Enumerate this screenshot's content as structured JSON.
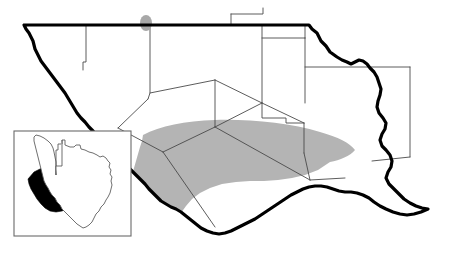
{
  "figure": {
    "type": "distribution-map",
    "region_name": "Trans-Pecos / Big Bend, Texas",
    "background_color": "#ffffff"
  },
  "colors": {
    "shaded_range": "#b4b4b4",
    "point_marker": "#a8a8a8",
    "state_border": "#000000",
    "county_border": "#4a4a4a",
    "inset_highlight": "#000000",
    "inset_frame": "#6a6a6a",
    "land_fill": "#ffffff"
  },
  "main_map": {
    "name": "trans-pecos-county-map",
    "state_outline_path": "M 24 25 L 309 25 L 312 29 L 317 33 L 321 41 L 326 46 L 330 52 L 337 57 L 342 60 L 347 62 L 351 64 L 355 62 L 359 60 L 363 61 L 367 64 L 370 68 L 374 72 L 377 77 L 379 83 L 381 89 L 380 95 L 378 101 L 377 107 L 379 113 L 383 118 L 386 123 L 385 129 L 382 134 L 380 140 L 382 146 L 386 150 L 390 155 L 392 161 L 391 167 L 388 172 L 386 178 L 389 184 L 394 189 L 399 194 L 404 199 L 410 203 L 416 206 L 422 208 L 428 209 L 421 212 L 414 214 L 407 215 L 400 214 L 393 212 L 386 209 L 380 206 L 374 202 L 369 198 L 363 195 L 357 193 L 351 192 L 345 192 L 339 191 L 333 189 L 327 187 L 321 186 L 315 186 L 309 187 L 303 189 L 297 192 L 291 195 L 285 199 L 279 203 L 273 207 L 267 211 L 261 215 L 255 219 L 249 222 L 243 225 L 237 228 L 231 231 L 225 233 L 219 234 L 213 233 L 207 231 L 201 228 L 196 224 L 191 220 L 186 216 L 181 212 L 176 209 L 171 207 L 166 204 L 161 201 L 157 197 L 153 193 L 149 189 L 145 184 L 141 180 L 137 176 L 133 172 L 129 168 L 125 164 L 121 160 L 117 156 L 113 152 L 109 148 L 105 144 L 101 140 L 97 136 L 93 131 L 89 127 L 85 122 L 81 118 L 77 113 L 74 108 L 71 103 L 68 98 L 65 93 L 62 89 L 59 85 L 56 81 L 53 77 L 50 73 L 47 69 L 44 65 L 41 61 L 39 57 L 37 53 L 35 49 L 34 45 L 33 41 L 31 37 L 29 33 L 26 29 Z",
    "county_lines": [
      {
        "name": "hudspeth-culberson-line",
        "path": "M 86 25 L 86 62 L 83 62 L 83 70"
      },
      {
        "name": "culberson-reeves-line",
        "path": "M 150 25 L 150 93 L 148 99"
      },
      {
        "name": "reeves-ward-line",
        "path": "M 150 93 L 215 80"
      },
      {
        "name": "jeff-davis-west-line",
        "path": "M 148 99 L 118 128"
      },
      {
        "name": "jeff-davis-south-line",
        "path": "M 118 128 L 163 152"
      },
      {
        "name": "jeff-davis-east-line",
        "path": "M 163 152 L 215 127"
      },
      {
        "name": "presidio-brewster-line",
        "path": "M 163 152 L 215 227"
      },
      {
        "name": "pecos-west-line",
        "path": "M 215 80 L 215 127"
      },
      {
        "name": "pecos-brewster-line",
        "path": "M 215 127 L 262 103"
      },
      {
        "name": "brewster-terrell-line",
        "path": "M 215 127 L 310 180"
      },
      {
        "name": "pecos-north-line",
        "path": "M 215 80 L 262 103"
      },
      {
        "name": "pecos-crockett-line",
        "path": "M 262 103 L 304 123"
      },
      {
        "name": "loving-winkler-line",
        "path": "M 231 14 L 231 25 L 262 25"
      },
      {
        "name": "loving-ward-box",
        "path": "M 231 14 L 263 14 L 263 8"
      },
      {
        "name": "winkler-ward-line",
        "path": "M 262 25 L 262 103"
      },
      {
        "name": "ward-crane-line",
        "path": "M 262 38 L 305 38"
      },
      {
        "name": "crane-upton-line",
        "path": "M 305 38 L 305 103"
      },
      {
        "name": "ward-north-line",
        "path": "M 305 38 L 305 25"
      },
      {
        "name": "crockett-north-line",
        "path": "M 305 67 L 410 67"
      },
      {
        "name": "crockett-east-line",
        "path": "M 410 67 L 410 157"
      },
      {
        "name": "crockett-south-line",
        "path": "M 410 157 L 372 161"
      },
      {
        "name": "val-verde-north-line",
        "path": "M 304 123 L 304 153"
      },
      {
        "name": "val-verde-terrell-line",
        "path": "M 304 153 L 310 180"
      },
      {
        "name": "terrell-east-line",
        "path": "M 310 180 L 345 178"
      },
      {
        "name": "pecos-step-line",
        "path": "M 262 103 L 262 118 L 286 118 L 286 123 L 304 123"
      }
    ],
    "shaded_region": {
      "name": "species-range-shaded-area",
      "label": "shaded distribution range",
      "path": "M 143 135 C 160 126, 185 121, 215 120 C 250 119, 290 123, 320 132 C 338 137, 350 143, 355 150 C 350 156, 340 160, 330 162 L 318 170 L 305 175 L 292 178 L 278 180 L 264 181 L 250 181 L 236 182 L 222 184 L 210 188 L 200 193 L 192 199 L 186 206 L 181 213 L 177 220 L 172 226 L 166 230 L 159 232 L 151 231 L 144 228 L 139 223 L 135 217 L 132 210 L 130 203 L 129 196 L 129 189 L 130 182 L 132 175 L 134 168 L 136 161 L 138 154 L 140 147 L 142 141 Z"
    },
    "point_markers": [
      {
        "name": "northern-locality-dot",
        "cx": 146,
        "cy": 23,
        "rx": 6,
        "ry": 8
      }
    ]
  },
  "inset_map": {
    "name": "texas-locator-inset",
    "frame": {
      "x": 14,
      "y": 131,
      "width": 117,
      "height": 105
    },
    "state_outline_path": "M 56 175 L 56 156 L 56 150 L 58 150 L 58 144 L 62 144 L 62 140 L 65 140 L 65 145 L 70 147 L 74 147 L 76 145 L 80 145 L 81 149 L 85 150 L 89 152 L 93 153 L 97 155 L 100 157 L 103 156 L 106 158 L 108 161 L 110 163 L 109 167 L 111 170 L 110 174 L 112 177 L 111 181 L 112 185 L 111 189 L 110 193 L 108 197 L 106 200 L 104 204 L 101 207 L 99 211 L 96 214 L 94 218 L 92 222 L 89 225 L 86 227 L 83 228 L 80 226 L 77 224 L 74 221 L 71 218 L 68 215 L 65 212 L 62 209 L 60 205 L 57 202 L 55 198 L 52 195 L 50 192 L 48 188 L 46 185 L 44 181 L 43 177 L 42 173 L 41 169 L 40 165 L 39 161 L 38 157 L 37 153 L 36 149 L 35 145 L 34 141 L 34 137 L 36 135 L 40 136 L 44 138 L 48 141 L 51 144 L 53 148 L 54 152 L 55 157 L 56 162 Z",
    "texas_panhandle_path": "M 62 140 L 62 166 L 56 166 L 56 175",
    "highlight_path": "M 28 179 L 34 172 L 42 168 L 50 167 L 58 168 L 58 174 L 66 174 L 66 180 L 74 180 L 74 187 L 82 187 L 82 194 L 78 199 L 73 204 L 68 208 L 62 211 L 56 212 L 50 211 L 45 208 L 41 204 L 37 199 L 34 194 L 31 189 L 29 184 Z",
    "highlight_label": "highlighted study area"
  }
}
